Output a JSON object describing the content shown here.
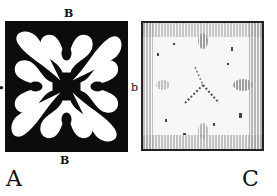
{
  "figures": [
    {
      "id": "A",
      "caption": "A",
      "style": "solid black ground with white ornament",
      "edge_labels": {
        "top": "B",
        "bottom": "B",
        "right": "b",
        "left": ""
      },
      "colors": {
        "ground": "#0c0c0c",
        "ornament": "#ffffff"
      }
    },
    {
      "id": "C",
      "caption": "C",
      "style": "hatched engraving, faint white cross ornament",
      "colors": {
        "ground": "#f4f4f4",
        "hatch": "#333333"
      }
    }
  ]
}
